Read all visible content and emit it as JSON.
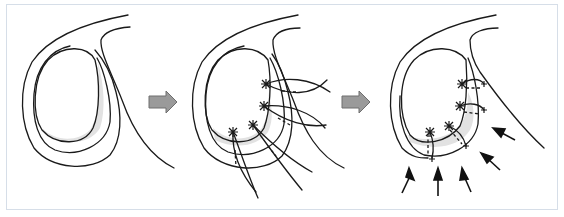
{
  "figure": {
    "type": "schematic surgical illustration",
    "panels": [
      {
        "id": "panel-1",
        "description": "Annular structure with crescent shaded defect region (before repair)"
      },
      {
        "id": "panel-2",
        "description": "Four sutures placed through annulus with pledget knots (asterisks) and dashed passes"
      },
      {
        "id": "panel-3",
        "description": "Sutures tied; compression arrows pointing toward repair"
      }
    ],
    "transition_arrows": 2,
    "force_arrows_panel_3": 5,
    "colors": {
      "frame_border": "#d6dee8",
      "outline": "#1a1a1a",
      "shaded_region": "#e2e2e2",
      "step_arrow_fill": "#9a9a9a"
    }
  }
}
